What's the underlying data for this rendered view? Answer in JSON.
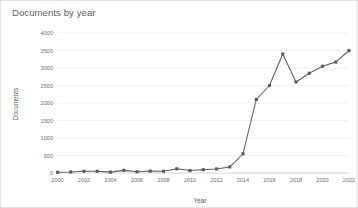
{
  "chart_data": {
    "type": "line",
    "title": "Documents by year",
    "xlabel": "Year",
    "ylabel": "Documents",
    "x": [
      2000,
      2001,
      2002,
      2003,
      2004,
      2005,
      2006,
      2007,
      2008,
      2009,
      2010,
      2011,
      2012,
      2013,
      2014,
      2015,
      2016,
      2017,
      2018,
      2019,
      2020,
      2021,
      2022
    ],
    "values": [
      20,
      30,
      50,
      50,
      25,
      75,
      35,
      55,
      50,
      120,
      70,
      95,
      115,
      170,
      550,
      2100,
      2500,
      3400,
      2600,
      2850,
      3050,
      3170,
      3500
    ],
    "series": [
      {
        "name": "Documents",
        "values": [
          20,
          30,
          50,
          50,
          25,
          75,
          35,
          55,
          50,
          120,
          70,
          95,
          115,
          170,
          550,
          2100,
          2500,
          3400,
          2600,
          2850,
          3050,
          3170,
          3500
        ]
      }
    ],
    "xlim": [
      2000,
      2022
    ],
    "ylim": [
      0,
      4000
    ],
    "xticks": [
      2000,
      2002,
      2004,
      2006,
      2008,
      2010,
      2012,
      2014,
      2016,
      2018,
      2020,
      2022
    ],
    "xtick_labels": [
      "2000",
      "2002",
      "2004",
      "2006",
      "2008",
      "2010",
      "2012",
      "2014",
      "2016",
      "2018",
      "2020",
      "2022"
    ],
    "yticks": [
      0,
      500,
      1000,
      1500,
      2000,
      2500,
      3000,
      3500,
      4000
    ],
    "ytick_labels": [
      "0",
      "500",
      "1000",
      "1500",
      "2000",
      "2500",
      "3000",
      "3500",
      "4000"
    ],
    "grid": "horizontal",
    "legend": "none",
    "marker": "square",
    "colors": {
      "line": "#5b5b5b",
      "marker": "#5b5b5b",
      "grid": "#e8e8e8",
      "axis": "#d0d0d0",
      "text": "#6e6e6e",
      "title": "#5a5a5a",
      "background": "#ffffff",
      "border": "#e3e3e3"
    }
  }
}
